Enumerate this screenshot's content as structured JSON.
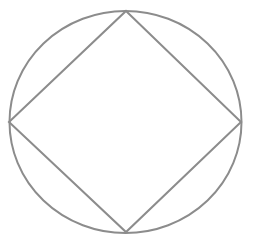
{
  "diagram": {
    "stroke_color": "#8c8c8c",
    "background_color": "#ffffff",
    "stroke_width": 2,
    "circle": {
      "cx": 125.5,
      "cy": 122,
      "rx": 116,
      "ry": 111
    },
    "square": {
      "vertices": [
        {
          "name": "top",
          "x": 126,
          "y": 11
        },
        {
          "name": "right",
          "x": 241,
          "y": 122
        },
        {
          "name": "bottom",
          "x": 126,
          "y": 232
        },
        {
          "name": "left",
          "x": 9,
          "y": 122
        }
      ]
    }
  }
}
